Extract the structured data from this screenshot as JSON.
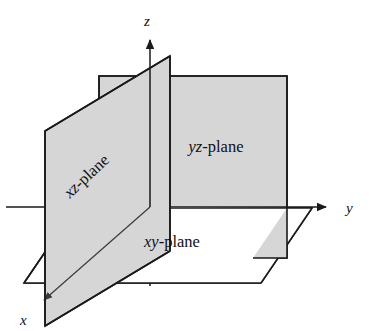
{
  "figure": {
    "width": 369,
    "height": 331,
    "background_color": "#ffffff",
    "plane_fill_color": "#d6d6d6",
    "line_color": "#1a1a1a",
    "text_color": "#111111"
  },
  "axes": [
    {
      "id": "x-axis",
      "label": "x",
      "label_style": "italic",
      "direction": "down-left",
      "label_position": {
        "x": 20,
        "y": 325
      },
      "origin": {
        "x": 150,
        "y": 207
      },
      "tip": {
        "x": 40,
        "y": 304
      },
      "arrowhead": true
    },
    {
      "id": "y-axis",
      "label": "y",
      "label_style": "italic",
      "direction": "right",
      "label_position": {
        "x": 346,
        "y": 213
      },
      "origin": {
        "x": 150,
        "y": 207
      },
      "tip": {
        "x": 332,
        "y": 207
      },
      "arrowhead": true
    },
    {
      "id": "z-axis",
      "label": "z",
      "label_style": "italic",
      "direction": "up",
      "label_position": {
        "x": 144,
        "y": 26
      },
      "origin": {
        "x": 150,
        "y": 285
      },
      "tip": {
        "x": 150,
        "y": 34
      },
      "arrowhead": true
    }
  ],
  "planes": [
    {
      "id": "yz-plane",
      "label_markup": {
        "variables": "yz",
        "suffix": "-plane"
      },
      "label_text": "yz-plane",
      "shape": "rectangle",
      "label_position": {
        "x": 216,
        "y": 152
      },
      "label_rotation_deg": 0,
      "vertices": "99,76 287,76 287,258 99,258",
      "fill": "#d6d6d6"
    },
    {
      "id": "xz-plane",
      "label_markup": {
        "variables": "xz",
        "suffix": "-plane"
      },
      "label_text": "xz-plane",
      "shape": "parallelogram",
      "label_position": {
        "x": 90,
        "y": 180
      },
      "label_rotation_deg": -43,
      "vertices": "45,131 170,56 170,251 45,326",
      "fill": "#d6d6d6"
    },
    {
      "id": "xy-plane",
      "label_markup": {
        "variables": "xy",
        "suffix": "-plane"
      },
      "label_text": "xy-plane",
      "shape": "parallelogram",
      "label_position": {
        "x": 172,
        "y": 247
      },
      "label_rotation_deg": 0,
      "vertices": "24,283 75,208 312,208 261,283",
      "fill": "#ffffff"
    }
  ]
}
